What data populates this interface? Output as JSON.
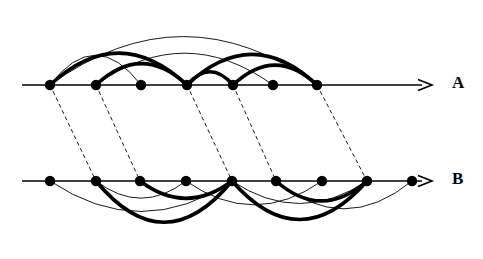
{
  "figure": {
    "type": "arc-diagram-pair",
    "width": 483,
    "height": 259,
    "background": "#ffffff",
    "stroke_color": "#000000",
    "thick_width": 3.6,
    "thin_width": 0.9,
    "axis_width": 1.5,
    "dash_width": 0.9,
    "dash_pattern": "4,3",
    "node_radius": 5.2
  },
  "lines": [
    {
      "id": "A",
      "label": "A",
      "label_x": 452,
      "label_y": 74,
      "axis_y": 85,
      "axis_x_start": 22,
      "axis_x_end": 432,
      "arrow_tip_x": 432,
      "arcs_side": "above",
      "nodes": [
        {
          "index": 1,
          "x": 50
        },
        {
          "index": 2,
          "x": 96
        },
        {
          "index": 3,
          "x": 141
        },
        {
          "index": 4,
          "x": 187
        },
        {
          "index": 5,
          "x": 233
        },
        {
          "index": 6,
          "x": 273
        },
        {
          "index": 7,
          "x": 317
        }
      ],
      "arcs": [
        {
          "from": 1,
          "to": 7,
          "weight": "thin",
          "height": 73
        },
        {
          "from": 1,
          "to": 3,
          "weight": "thin",
          "height": 45
        },
        {
          "from": 2,
          "to": 6,
          "weight": "thin",
          "height": 48
        },
        {
          "from": 1,
          "to": 4,
          "weight": "thick",
          "height": 48
        },
        {
          "from": 2,
          "to": 4,
          "weight": "thick",
          "height": 32
        },
        {
          "from": 4,
          "to": 5,
          "weight": "thick",
          "height": 20
        },
        {
          "from": 4,
          "to": 7,
          "weight": "thick",
          "height": 46
        },
        {
          "from": 5,
          "to": 7,
          "weight": "thick",
          "height": 30
        }
      ]
    },
    {
      "id": "B",
      "label": "B",
      "label_x": 452,
      "label_y": 170,
      "axis_y": 181,
      "axis_x_start": 22,
      "axis_x_end": 432,
      "arrow_tip_x": 432,
      "arcs_side": "below",
      "nodes": [
        {
          "index": 1,
          "x": 50
        },
        {
          "index": 2,
          "x": 96
        },
        {
          "index": 3,
          "x": 140
        },
        {
          "index": 4,
          "x": 186
        },
        {
          "index": 5,
          "x": 232
        },
        {
          "index": 6,
          "x": 276
        },
        {
          "index": 7,
          "x": 322
        },
        {
          "index": 8,
          "x": 367
        },
        {
          "index": 9,
          "x": 412
        }
      ],
      "arcs": [
        {
          "from": 1,
          "to": 5,
          "weight": "thin",
          "height": 46
        },
        {
          "from": 2,
          "to": 4,
          "weight": "thin",
          "height": 26
        },
        {
          "from": 4,
          "to": 7,
          "weight": "thin",
          "height": 36
        },
        {
          "from": 5,
          "to": 8,
          "weight": "thin",
          "height": 34
        },
        {
          "from": 6,
          "to": 9,
          "weight": "thin",
          "height": 42
        },
        {
          "from": 2,
          "to": 5,
          "weight": "thick",
          "height": 62
        },
        {
          "from": 3,
          "to": 5,
          "weight": "thick",
          "height": 26
        },
        {
          "from": 5,
          "to": 8,
          "weight": "thick",
          "height": 58
        },
        {
          "from": 6,
          "to": 8,
          "weight": "thick",
          "height": 30
        }
      ]
    }
  ],
  "connectors": [
    {
      "from_line": "A",
      "from_node": 1,
      "to_line": "B",
      "to_node": 2
    },
    {
      "from_line": "A",
      "from_node": 2,
      "to_line": "B",
      "to_node": 3
    },
    {
      "from_line": "A",
      "from_node": 4,
      "to_line": "B",
      "to_node": 5
    },
    {
      "from_line": "A",
      "from_node": 5,
      "to_line": "B",
      "to_node": 6
    },
    {
      "from_line": "A",
      "from_node": 7,
      "to_line": "B",
      "to_node": 8
    }
  ]
}
